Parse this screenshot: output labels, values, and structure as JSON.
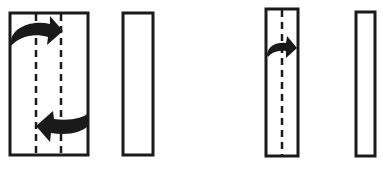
{
  "diagram": {
    "colors": {
      "stroke": "#1a1a1a",
      "background": "#ffffff"
    },
    "steps": [
      {
        "id": "fold-in-thirds",
        "before": {
          "x": 10,
          "y": 13,
          "w": 78,
          "h": 142,
          "fold_lines_x": [
            36,
            61
          ]
        },
        "after": {
          "x": 123,
          "y": 13,
          "w": 30,
          "h": 142
        },
        "arrows": [
          {
            "direction": "right",
            "from": "left-edge",
            "to": "fold-line-2",
            "y": 33
          },
          {
            "direction": "left",
            "from": "right-edge",
            "to": "fold-line-1",
            "y": 122
          }
        ]
      },
      {
        "id": "fold-in-half",
        "before": {
          "x": 266,
          "y": 9,
          "w": 32,
          "h": 147,
          "fold_lines_x": [
            282
          ]
        },
        "after": {
          "x": 356,
          "y": 12,
          "w": 19,
          "h": 144
        },
        "arrows": [
          {
            "direction": "right",
            "from": "left-edge",
            "to": "right-edge",
            "y": 48
          }
        ]
      }
    ]
  }
}
